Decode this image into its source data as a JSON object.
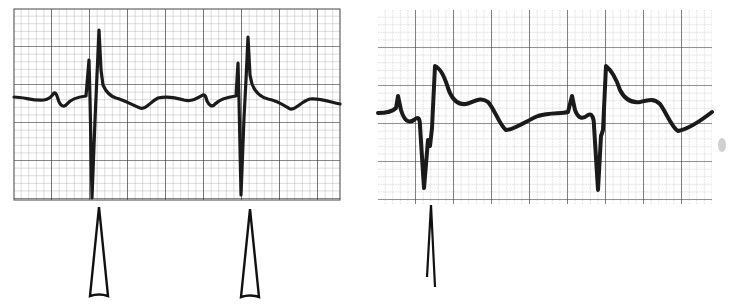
{
  "figure": {
    "colors": {
      "background": "#ffffff",
      "ink": "#1a1a1a",
      "grid_major": "#3a3a3a",
      "grid_minor": "#8a8a8a"
    },
    "panels": [
      {
        "id": "left",
        "grid": {
          "x": 14,
          "y": 9,
          "width": 326,
          "height": 191,
          "major_spacing": 38,
          "minor_per_major": 5,
          "minor_style": "solid"
        },
        "baseline_y": 100,
        "beats_x": [
          92,
          241
        ],
        "markers": [
          {
            "type": "hollow-triangle-arrow",
            "x": 99,
            "top_y": 207,
            "bottom_y": 296
          },
          {
            "type": "hollow-triangle-arrow",
            "x": 250,
            "top_y": 209,
            "bottom_y": 297
          }
        ]
      },
      {
        "id": "right",
        "grid": {
          "x": 378,
          "y": 10,
          "width": 334,
          "height": 194,
          "major_spacing": 38,
          "minor_per_major": 5,
          "minor_style": "dotted"
        },
        "baseline_y": 113,
        "beats_x": [
          426,
          598
        ],
        "markers": [
          {
            "type": "open-line-arrow",
            "x": 431,
            "top_y": 205,
            "bottom_y": 287
          }
        ]
      }
    ]
  }
}
